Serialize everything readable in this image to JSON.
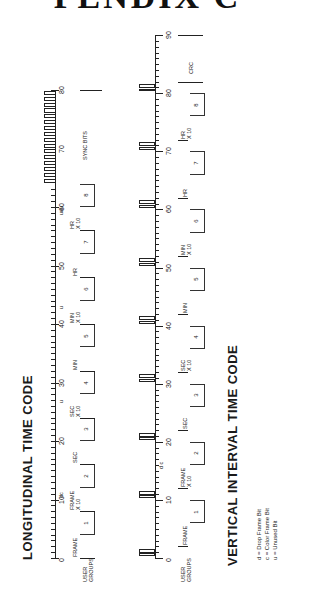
{
  "header": {
    "title_fragment": "PENDIX C"
  },
  "ltc": {
    "title": "LONGITUDINAL  TIME  CODE",
    "scale_labels": [
      "0",
      "10",
      "20",
      "30",
      "40",
      "50",
      "60",
      "70",
      "80"
    ],
    "groups": [
      {
        "label": "FRAME",
        "num": "1"
      },
      {
        "label": "FRAME X 10",
        "num": "2"
      },
      {
        "label": "SEC",
        "num": "3"
      },
      {
        "label": "SEC X 10",
        "num": "4"
      },
      {
        "label": "MIN",
        "num": "5"
      },
      {
        "label": "MIN X 10",
        "num": "6"
      },
      {
        "label": "HR",
        "num": "7"
      },
      {
        "label": "HR X 10",
        "num": "8"
      }
    ],
    "user_groups_label": "USER GROUPS",
    "sync_label": "SYNC  BITS",
    "bit_marks": {
      "dc": "dc",
      "u1": "u",
      "u2": "u",
      "uuu": "uuu"
    }
  },
  "vitc": {
    "title": "VERTICAL  INTERVAL  TIME  CODE",
    "scale_labels": [
      "0",
      "10",
      "20",
      "30",
      "40",
      "50",
      "60",
      "70",
      "80",
      "90"
    ],
    "groups": [
      {
        "label": "FRAME",
        "num": "1"
      },
      {
        "label": "FRAME X 10",
        "num": "2"
      },
      {
        "label": "SEC",
        "num": "3"
      },
      {
        "label": "SEC X 10",
        "num": "4"
      },
      {
        "label": "MIN",
        "num": "5"
      },
      {
        "label": "MIN X 10",
        "num": "6"
      },
      {
        "label": "HR",
        "num": "7"
      },
      {
        "label": "HR X 10",
        "num": "8"
      }
    ],
    "user_groups_label": "USER GROUPS",
    "crc_label": "CRC",
    "bit_marks": {
      "dc": "d c"
    }
  },
  "legend": {
    "items": [
      "d = Drop Frame Bit",
      "c = Color Frame Bit",
      "u = Unused Bit"
    ]
  }
}
